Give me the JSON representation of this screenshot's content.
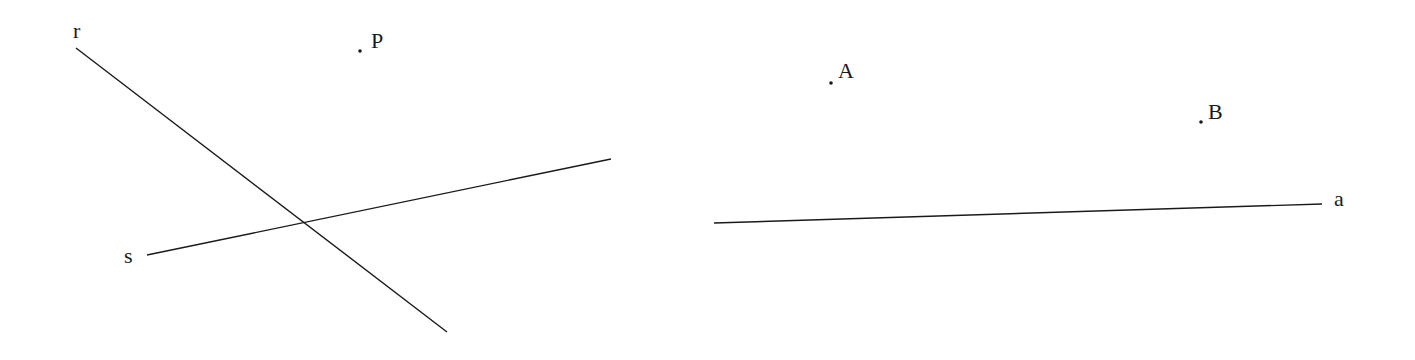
{
  "figure": {
    "left_panel": {
      "lines": [
        {
          "id": "r",
          "label": "r",
          "x1": 76,
          "y1": 48,
          "x2": 447,
          "y2": 332,
          "label_x": 73,
          "label_y": 20
        },
        {
          "id": "s",
          "label": "s",
          "x1": 147,
          "y1": 255,
          "x2": 611,
          "y2": 159,
          "label_x": 124,
          "label_y": 245
        }
      ],
      "points": [
        {
          "id": "P",
          "label": "P",
          "x": 360,
          "y": 51,
          "label_x": 371,
          "label_y": 30
        }
      ]
    },
    "right_panel": {
      "lines": [
        {
          "id": "a",
          "label": "a",
          "x1": 714,
          "y1": 223,
          "x2": 1322,
          "y2": 204,
          "label_x": 1334,
          "label_y": 188
        }
      ],
      "points": [
        {
          "id": "A",
          "label": "A",
          "x": 831,
          "y": 83,
          "label_x": 838,
          "label_y": 60
        },
        {
          "id": "B",
          "label": "B",
          "x": 1201,
          "y": 122,
          "label_x": 1208,
          "label_y": 101
        }
      ]
    },
    "stroke_color": "#1a1a1a",
    "background": "#ffffff"
  }
}
